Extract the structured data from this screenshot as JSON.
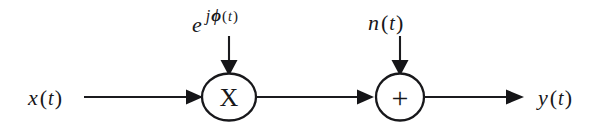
{
  "figure": {
    "type": "signal-flow-block-diagram",
    "background_color": "#ffffff",
    "ink_color": "#17171a",
    "width": 608,
    "height": 131
  },
  "labels": {
    "input": {
      "name": "x",
      "arg_open": "(",
      "arg": "t",
      "arg_close": ")",
      "full": "x(t)"
    },
    "output": {
      "name": "y",
      "arg_open": "(",
      "arg": "t",
      "arg_close": ")",
      "full": "y(t)"
    },
    "noise": {
      "name": "n",
      "arg_open": "(",
      "arg": "t",
      "arg_close": ")",
      "full": "n(t)"
    },
    "phase_exponential": {
      "base": "e",
      "sup_j": "j",
      "sup_phi": "ϕ",
      "sup_open": "(",
      "sup_arg": "t",
      "sup_close": ")",
      "full": "e^{jϕ(t)}"
    }
  },
  "nodes": {
    "multiplier": {
      "glyph": "X",
      "shape": "ellipse",
      "role": "multiply",
      "cx": 229,
      "cy": 97,
      "rx": 27,
      "ry": 23.5
    },
    "adder": {
      "glyph": "+",
      "shape": "circle",
      "role": "sum",
      "cx": 400,
      "cy": 97,
      "rx": 24,
      "ry": 23.5
    }
  },
  "connections": [
    {
      "id": "input-wire",
      "from": "x(t)",
      "to": "multiplier",
      "orientation": "horizontal"
    },
    {
      "id": "phase-wire",
      "from": "e^{jϕ(t)}",
      "to": "multiplier",
      "orientation": "vertical"
    },
    {
      "id": "mid-wire",
      "from": "multiplier",
      "to": "adder",
      "orientation": "horizontal"
    },
    {
      "id": "noise-wire",
      "from": "n(t)",
      "to": "adder",
      "orientation": "vertical"
    },
    {
      "id": "output-wire",
      "from": "adder",
      "to": "y(t)",
      "orientation": "horizontal"
    }
  ]
}
